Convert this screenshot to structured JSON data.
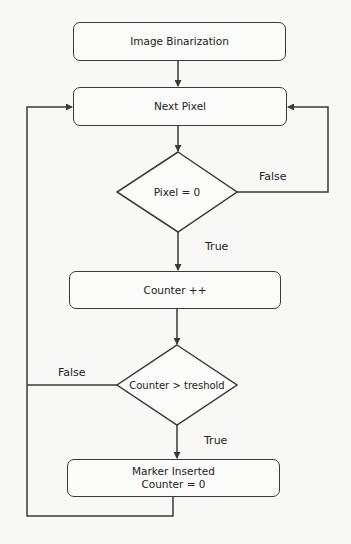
{
  "diagram": {
    "type": "flowchart",
    "colors": {
      "background": "#f8f8f6",
      "stroke": "#3a3a3a",
      "text": "#222222"
    },
    "nodes": {
      "binarization": {
        "label": "Image Binarization",
        "shape": "rounded-rect"
      },
      "next_pixel": {
        "label": "Next Pixel",
        "shape": "rounded-rect"
      },
      "pixel_check": {
        "label": "Pixel = 0",
        "shape": "diamond"
      },
      "counter_inc": {
        "label": "Counter ++",
        "shape": "rounded-rect"
      },
      "threshold_check": {
        "label": "Counter > treshold",
        "shape": "diamond"
      },
      "marker": {
        "line1": "Marker Inserted",
        "line2": "Counter = 0",
        "shape": "rounded-rect"
      }
    },
    "edges": {
      "pixel_false": "False",
      "pixel_true": "True",
      "threshold_false": "False",
      "threshold_true": "True"
    },
    "connections": [
      {
        "from": "binarization",
        "to": "next_pixel"
      },
      {
        "from": "next_pixel",
        "to": "pixel_check"
      },
      {
        "from": "pixel_check",
        "to": "counter_inc",
        "label": "True"
      },
      {
        "from": "pixel_check",
        "to": "next_pixel",
        "label": "False"
      },
      {
        "from": "counter_inc",
        "to": "threshold_check"
      },
      {
        "from": "threshold_check",
        "to": "marker",
        "label": "True"
      },
      {
        "from": "threshold_check",
        "to": "next_pixel",
        "label": "False"
      },
      {
        "from": "marker",
        "to": "next_pixel"
      }
    ]
  }
}
